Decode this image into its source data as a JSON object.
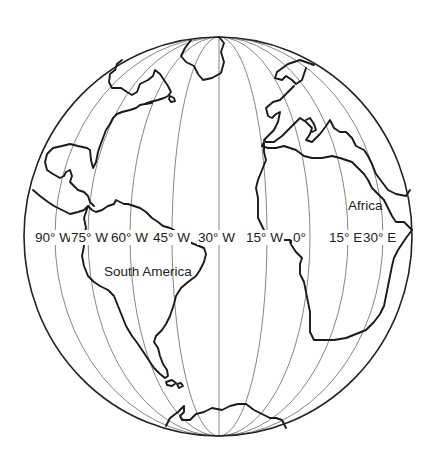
{
  "map": {
    "projection": "orthographic globe centered near 30° W, 0°",
    "continents": {
      "africa": "Africa",
      "south_america": "South America"
    },
    "longitude_labels": [
      {
        "id": "lon-90w",
        "text": "90° W",
        "x": 34
      },
      {
        "id": "lon-75w",
        "text": "75° W",
        "x": 72
      },
      {
        "id": "lon-60w",
        "text": "60° W",
        "x": 113
      },
      {
        "id": "lon-45w",
        "text": "45° W",
        "x": 155
      },
      {
        "id": "lon-30w",
        "text": "30° W",
        "x": 199
      },
      {
        "id": "lon-15w",
        "text": "15° W",
        "x": 248
      },
      {
        "id": "lon-0",
        "text": "0°",
        "x": 295
      },
      {
        "id": "lon-15e",
        "text": "15° E",
        "x": 329
      },
      {
        "id": "lon-30e",
        "text": "30° E",
        "x": 364
      }
    ],
    "colors": {
      "background": "#ffffff",
      "outline": "#222222",
      "meridian": "#777777",
      "coastline": "#1a1a1a",
      "text": "#222222"
    }
  }
}
